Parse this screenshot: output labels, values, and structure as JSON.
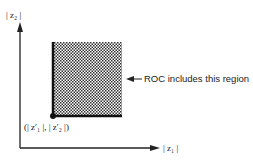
{
  "diagram": {
    "y_axis_label": "| z₂ |",
    "x_axis_label": "| z₁ |",
    "point_label": "(| z′₁ |, | z′₂ |)",
    "annotation": "ROC includes this region",
    "region_color": "#555555",
    "axis_color": "#222222"
  }
}
